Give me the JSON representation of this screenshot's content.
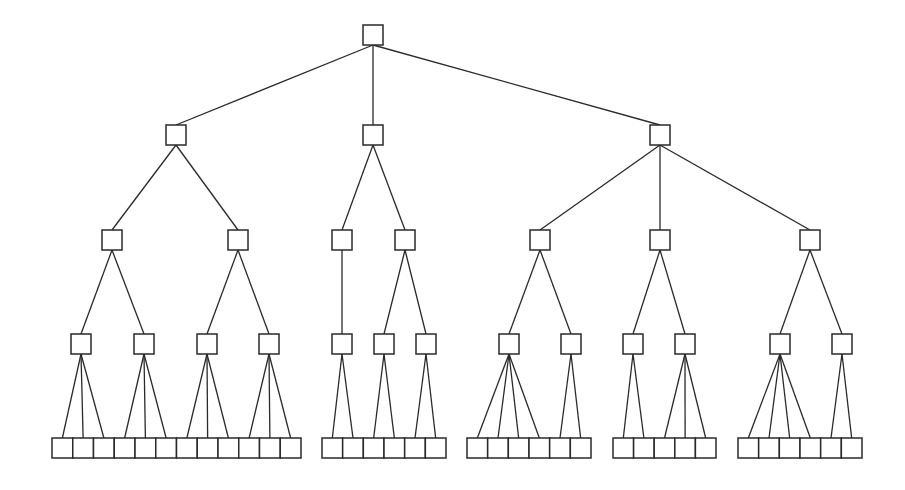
{
  "diagram": {
    "type": "tree",
    "style": {
      "stroke": "#2a2a2a",
      "node_fill": "#ffffff",
      "background": "#ffffff",
      "node_size": 20
    },
    "levels": [
      {
        "level": 0,
        "y": 25,
        "nodes": [
          {
            "id": "r",
            "cx": 373
          }
        ]
      },
      {
        "level": 1,
        "y": 125,
        "nodes": [
          {
            "id": "a",
            "cx": 176,
            "parent": "r"
          },
          {
            "id": "b",
            "cx": 373,
            "parent": "r"
          },
          {
            "id": "c",
            "cx": 660,
            "parent": "r"
          }
        ]
      },
      {
        "level": 2,
        "y": 230,
        "nodes": [
          {
            "id": "a1",
            "cx": 112,
            "parent": "a"
          },
          {
            "id": "a2",
            "cx": 238,
            "parent": "a"
          },
          {
            "id": "b1",
            "cx": 342,
            "parent": "b"
          },
          {
            "id": "b2",
            "cx": 405,
            "parent": "b"
          },
          {
            "id": "c1",
            "cx": 540,
            "parent": "c"
          },
          {
            "id": "c2",
            "cx": 660,
            "parent": "c"
          },
          {
            "id": "c3",
            "cx": 810,
            "parent": "c"
          }
        ]
      },
      {
        "level": 3,
        "y": 334,
        "nodes": [
          {
            "id": "a1x",
            "cx": 81,
            "parent": "a1"
          },
          {
            "id": "a1y",
            "cx": 144,
            "parent": "a1"
          },
          {
            "id": "a2x",
            "cx": 207,
            "parent": "a2"
          },
          {
            "id": "a2y",
            "cx": 269,
            "parent": "a2"
          },
          {
            "id": "b1x",
            "cx": 342,
            "parent": "b1"
          },
          {
            "id": "b2x",
            "cx": 384,
            "parent": "b2"
          },
          {
            "id": "b2y",
            "cx": 426,
            "parent": "b2"
          },
          {
            "id": "c1x",
            "cx": 509,
            "parent": "c1"
          },
          {
            "id": "c1y",
            "cx": 571,
            "parent": "c1"
          },
          {
            "id": "c2x",
            "cx": 633,
            "parent": "c2"
          },
          {
            "id": "c2y",
            "cx": 685,
            "parent": "c2"
          },
          {
            "id": "c3x",
            "cx": 780,
            "parent": "c3"
          },
          {
            "id": "c3y",
            "cx": 842,
            "parent": "c3"
          }
        ]
      }
    ],
    "leaf_row": {
      "y": 438,
      "height": 20,
      "groups": [
        {
          "x0": 52,
          "x1": 301,
          "count": 12,
          "parents": [
            "a1x",
            "a1x",
            "a1x",
            "a1y",
            "a1y",
            "a1y",
            "a2x",
            "a2x",
            "a2x",
            "a2y",
            "a2y",
            "a2y"
          ]
        },
        {
          "x0": 322,
          "x1": 446,
          "count": 6,
          "parents": [
            "b1x",
            "b1x",
            "b2x",
            "b2x",
            "b2y",
            "b2y"
          ]
        },
        {
          "x0": 467,
          "x1": 591,
          "count": 6,
          "parents": [
            "c1x",
            "c1x",
            "c1x",
            "c1x",
            "c1y",
            "c1y"
          ]
        },
        {
          "x0": 613,
          "x1": 716,
          "count": 5,
          "parents": [
            "c2x",
            "c2x",
            "c2y",
            "c2y",
            "c2y"
          ]
        },
        {
          "x0": 738,
          "x1": 862,
          "count": 6,
          "parents": [
            "c3x",
            "c3x",
            "c3x",
            "c3x",
            "c3y",
            "c3y"
          ]
        }
      ]
    },
    "summary": {
      "depth": 5,
      "root_children": 3,
      "internal_nodes": 24,
      "leaf_nodes": 35,
      "labels": []
    }
  }
}
